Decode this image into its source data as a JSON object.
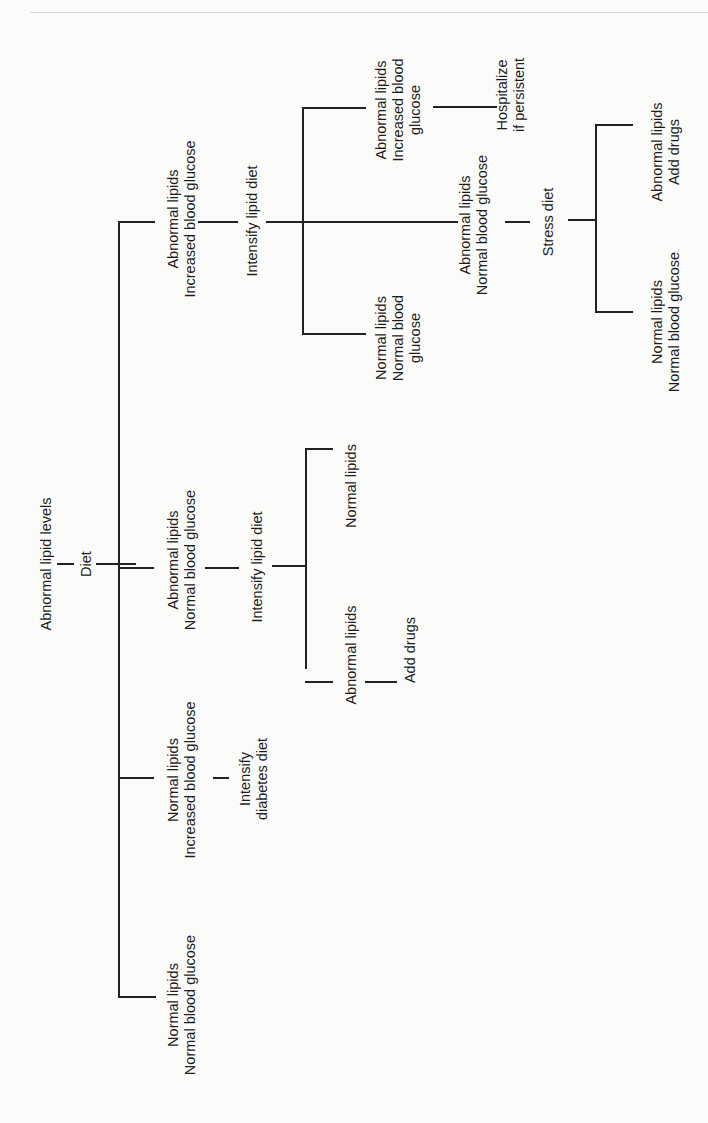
{
  "diagram": {
    "root": "Abnormal lipid levels",
    "root_action": "Diet",
    "branches": [
      {
        "id": "b1",
        "condition": "Abnormal lipids\nIncreased blood glucose",
        "action": "Intensify lipid diet",
        "outcomes": [
          {
            "condition": "Abnormal lipids\nIncreased blood\nglucose",
            "action": "Hospitalize\nif persistent"
          },
          {
            "condition": "Abnormal lipids\nNormal blood glucose",
            "action": "Stress diet",
            "outcomes": [
              {
                "condition": "Abnormal lipids\nAdd drugs"
              },
              {
                "condition": "Normal lipids\nNormal blood glucose"
              }
            ]
          },
          {
            "condition": "Normal lipids\nNormal blood\nglucose"
          }
        ]
      },
      {
        "id": "b2",
        "condition": "Abnormal lipids\nNormal blood glucose",
        "action": "Intensify lipid diet",
        "outcomes": [
          {
            "condition": "Normal lipids"
          },
          {
            "condition": "Abnormal lipids",
            "action": "Add drugs"
          }
        ]
      },
      {
        "id": "b3",
        "condition": "Normal lipids\nIncreased blood glucose",
        "action": "Intensify\ndiabetes diet"
      },
      {
        "id": "b4",
        "condition": "Normal lipids\nNormal blood glucose"
      }
    ]
  }
}
